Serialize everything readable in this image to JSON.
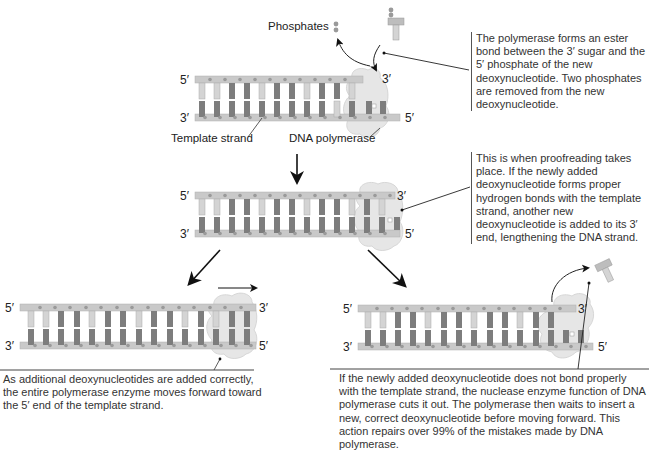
{
  "labels": {
    "phosphates": "Phosphates",
    "template_strand": "Template strand",
    "dna_polymerase": "DNA polymerase"
  },
  "strand_ends": {
    "five_prime": "5′",
    "three_prime": "3′"
  },
  "captions": {
    "step1": "The polymerase forms an ester bond between the 3′ sugar and the 5′ phosphate of the new deoxynucleotide. Two phosphates are removed from the new deoxynucleotide.",
    "step2": "This is when proofreading takes place. If the newly added deoxynucleotide forms proper hydrogen bonds with the template strand, another new deoxynucleotide is added to its 3′ end, lengthening the DNA strand.",
    "step3_correct": "As additional deoxynucleotides are added correctly, the entire polymerase enzyme moves forward toward the 5′ end of the template strand.",
    "step3_incorrect": "If the newly added deoxynucleotide does not bond properly with the template strand, the nuclease enzyme function of DNA polymerase cuts it out. The polymerase then waits to insert a new, correct deoxynucleotide before moving forward. This action repairs over 99% of the mistakes made by DNA polymerase."
  },
  "colors": {
    "backbone": "#c9c9c9",
    "backbone_dot": "#9a9a9a",
    "base_dark": "#7d7d7d",
    "base_light": "#d4d4d4",
    "polymerase": "#e6e6e6",
    "arrow": "#111111"
  }
}
